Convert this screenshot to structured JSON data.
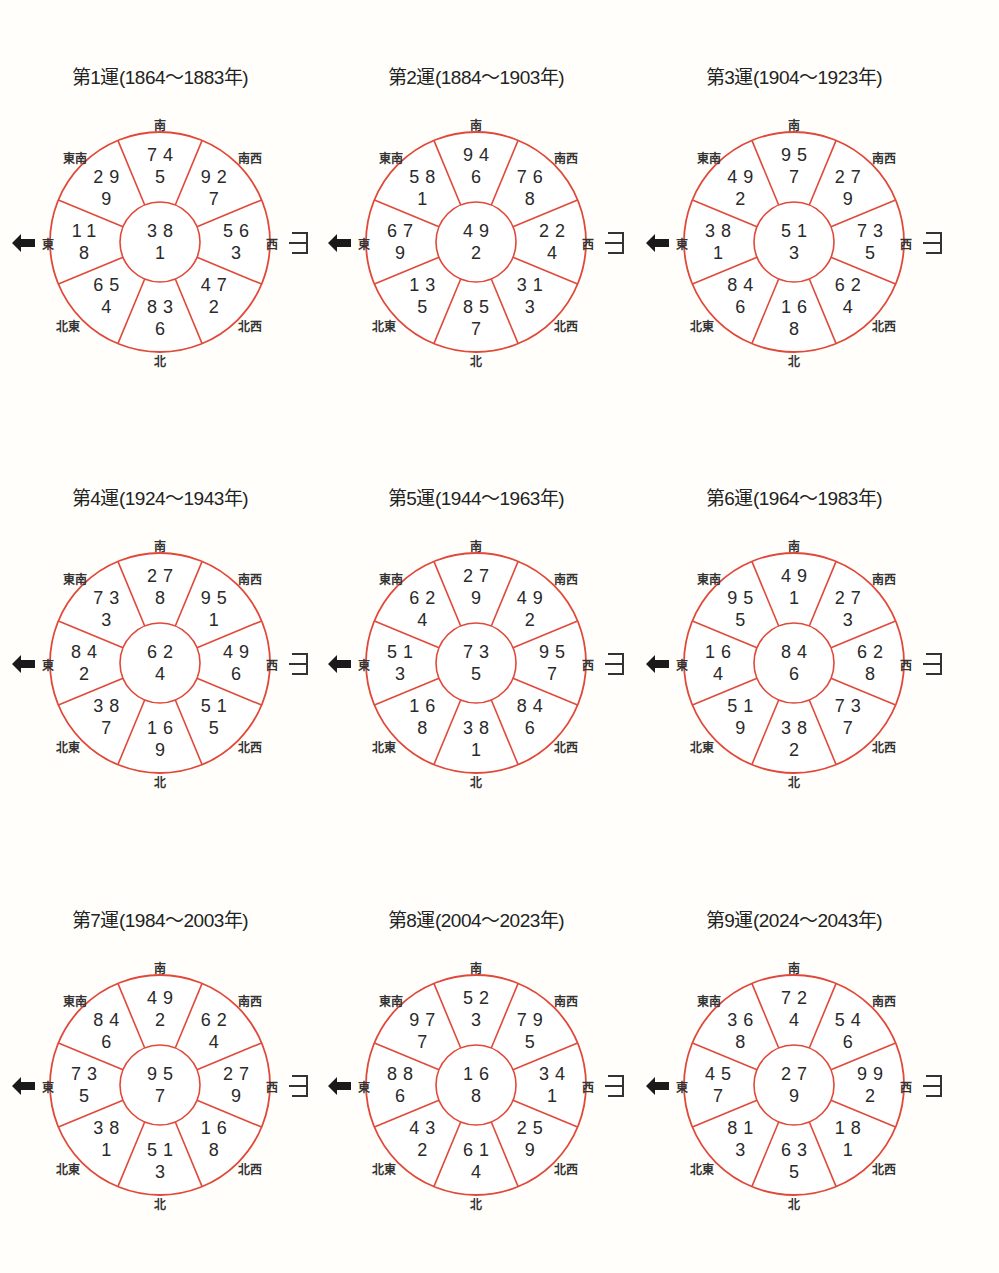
{
  "direction_labels": {
    "S": "南",
    "SW": "南西",
    "W": "西",
    "NW": "北西",
    "N": "北",
    "NE": "北東",
    "E": "東",
    "SE": "東南"
  },
  "colors": {
    "circle_stroke": "#e0493a",
    "text": "#2a2a2a",
    "background": "#fffefa"
  },
  "chart_data": [
    {
      "type": "table",
      "title": "第1運(1864〜1883年)",
      "center": {
        "mountain": 3,
        "water": 8,
        "base": 1
      },
      "S": {
        "mountain": 7,
        "water": 4,
        "base": 5
      },
      "SW": {
        "mountain": 9,
        "water": 2,
        "base": 7
      },
      "W": {
        "mountain": 5,
        "water": 6,
        "base": 3
      },
      "NW": {
        "mountain": 4,
        "water": 7,
        "base": 2
      },
      "N": {
        "mountain": 8,
        "water": 3,
        "base": 6
      },
      "NE": {
        "mountain": 6,
        "water": 5,
        "base": 4
      },
      "E": {
        "mountain": 1,
        "water": 1,
        "base": 8
      },
      "SE": {
        "mountain": 2,
        "water": 9,
        "base": 9
      }
    },
    {
      "type": "table",
      "title": "第2運(1884〜1903年)",
      "center": {
        "mountain": 4,
        "water": 9,
        "base": 2
      },
      "S": {
        "mountain": 9,
        "water": 4,
        "base": 6
      },
      "SW": {
        "mountain": 7,
        "water": 6,
        "base": 8
      },
      "W": {
        "mountain": 2,
        "water": 2,
        "base": 4
      },
      "NW": {
        "mountain": 3,
        "water": 1,
        "base": 3
      },
      "N": {
        "mountain": 8,
        "water": 5,
        "base": 7
      },
      "NE": {
        "mountain": 1,
        "water": 3,
        "base": 5
      },
      "E": {
        "mountain": 6,
        "water": 7,
        "base": 9
      },
      "SE": {
        "mountain": 5,
        "water": 8,
        "base": 1
      }
    },
    {
      "type": "table",
      "title": "第3運(1904〜1923年)",
      "center": {
        "mountain": 5,
        "water": 1,
        "base": 3
      },
      "S": {
        "mountain": 9,
        "water": 5,
        "base": 7
      },
      "SW": {
        "mountain": 2,
        "water": 7,
        "base": 9
      },
      "W": {
        "mountain": 7,
        "water": 3,
        "base": 5
      },
      "NW": {
        "mountain": 6,
        "water": 2,
        "base": 4
      },
      "N": {
        "mountain": 1,
        "water": 6,
        "base": 8
      },
      "NE": {
        "mountain": 8,
        "water": 4,
        "base": 6
      },
      "E": {
        "mountain": 3,
        "water": 8,
        "base": 1
      },
      "SE": {
        "mountain": 4,
        "water": 9,
        "base": 2
      }
    },
    {
      "type": "table",
      "title": "第4運(1924〜1943年)",
      "center": {
        "mountain": 6,
        "water": 2,
        "base": 4
      },
      "S": {
        "mountain": 2,
        "water": 7,
        "base": 8
      },
      "SW": {
        "mountain": 9,
        "water": 5,
        "base": 1
      },
      "W": {
        "mountain": 4,
        "water": 9,
        "base": 6
      },
      "NW": {
        "mountain": 5,
        "water": 1,
        "base": 5
      },
      "N": {
        "mountain": 1,
        "water": 6,
        "base": 9
      },
      "NE": {
        "mountain": 3,
        "water": 8,
        "base": 7
      },
      "E": {
        "mountain": 8,
        "water": 4,
        "base": 2
      },
      "SE": {
        "mountain": 7,
        "water": 3,
        "base": 3
      }
    },
    {
      "type": "table",
      "title": "第5運(1944〜1963年)",
      "center": {
        "mountain": 7,
        "water": 3,
        "base": 5
      },
      "S": {
        "mountain": 2,
        "water": 7,
        "base": 9
      },
      "SW": {
        "mountain": 4,
        "water": 9,
        "base": 2
      },
      "W": {
        "mountain": 9,
        "water": 5,
        "base": 7
      },
      "NW": {
        "mountain": 8,
        "water": 4,
        "base": 6
      },
      "N": {
        "mountain": 3,
        "water": 8,
        "base": 1
      },
      "NE": {
        "mountain": 1,
        "water": 6,
        "base": 8
      },
      "E": {
        "mountain": 5,
        "water": 1,
        "base": 3
      },
      "SE": {
        "mountain": 6,
        "water": 2,
        "base": 4
      }
    },
    {
      "type": "table",
      "title": "第6運(1964〜1983年)",
      "center": {
        "mountain": 8,
        "water": 4,
        "base": 6
      },
      "S": {
        "mountain": 4,
        "water": 9,
        "base": 1
      },
      "SW": {
        "mountain": 2,
        "water": 7,
        "base": 3
      },
      "W": {
        "mountain": 6,
        "water": 2,
        "base": 8
      },
      "NW": {
        "mountain": 7,
        "water": 3,
        "base": 7
      },
      "N": {
        "mountain": 3,
        "water": 8,
        "base": 2
      },
      "NE": {
        "mountain": 5,
        "water": 1,
        "base": 9
      },
      "E": {
        "mountain": 1,
        "water": 6,
        "base": 4
      },
      "SE": {
        "mountain": 9,
        "water": 5,
        "base": 5
      }
    },
    {
      "type": "table",
      "title": "第7運(1984〜2003年)",
      "center": {
        "mountain": 9,
        "water": 5,
        "base": 7
      },
      "S": {
        "mountain": 4,
        "water": 9,
        "base": 2
      },
      "SW": {
        "mountain": 6,
        "water": 2,
        "base": 4
      },
      "W": {
        "mountain": 2,
        "water": 7,
        "base": 9
      },
      "NW": {
        "mountain": 1,
        "water": 6,
        "base": 8
      },
      "N": {
        "mountain": 5,
        "water": 1,
        "base": 3
      },
      "NE": {
        "mountain": 3,
        "water": 8,
        "base": 1
      },
      "E": {
        "mountain": 7,
        "water": 3,
        "base": 5
      },
      "SE": {
        "mountain": 8,
        "water": 4,
        "base": 6
      }
    },
    {
      "type": "table",
      "title": "第8運(2004〜2023年)",
      "center": {
        "mountain": 1,
        "water": 6,
        "base": 8
      },
      "S": {
        "mountain": 5,
        "water": 2,
        "base": 3
      },
      "SW": {
        "mountain": 7,
        "water": 9,
        "base": 5
      },
      "W": {
        "mountain": 3,
        "water": 4,
        "base": 1
      },
      "NW": {
        "mountain": 2,
        "water": 5,
        "base": 9
      },
      "N": {
        "mountain": 6,
        "water": 1,
        "base": 4
      },
      "NE": {
        "mountain": 4,
        "water": 3,
        "base": 2
      },
      "E": {
        "mountain": 8,
        "water": 8,
        "base": 6
      },
      "SE": {
        "mountain": 9,
        "water": 7,
        "base": 7
      }
    },
    {
      "type": "table",
      "title": "第9運(2024〜2043年)",
      "center": {
        "mountain": 2,
        "water": 7,
        "base": 9
      },
      "S": {
        "mountain": 7,
        "water": 2,
        "base": 4
      },
      "SW": {
        "mountain": 5,
        "water": 4,
        "base": 6
      },
      "W": {
        "mountain": 9,
        "water": 9,
        "base": 2
      },
      "NW": {
        "mountain": 1,
        "water": 8,
        "base": 1
      },
      "N": {
        "mountain": 6,
        "water": 3,
        "base": 5
      },
      "NE": {
        "mountain": 8,
        "water": 1,
        "base": 3
      },
      "E": {
        "mountain": 4,
        "water": 5,
        "base": 7
      },
      "SE": {
        "mountain": 3,
        "water": 6,
        "base": 8
      }
    }
  ]
}
